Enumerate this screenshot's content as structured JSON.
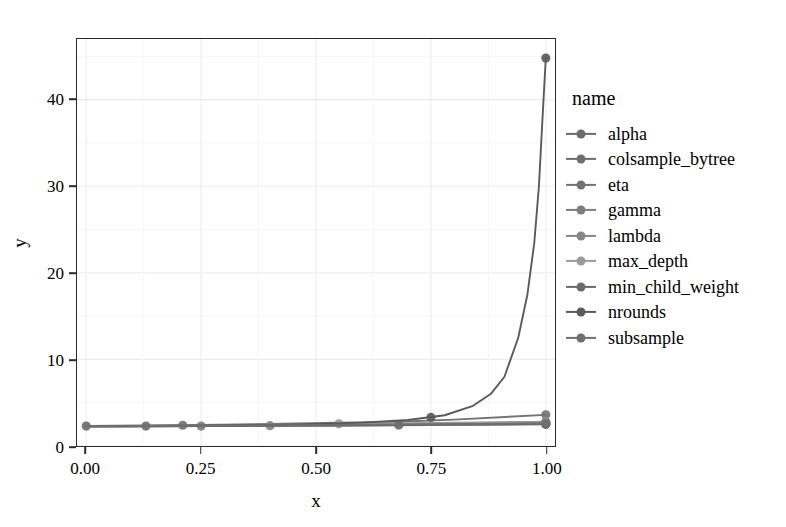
{
  "chart_data": {
    "type": "line",
    "title": "",
    "xlabel": "x",
    "ylabel": "y",
    "xlim": [
      -0.02,
      1.02
    ],
    "ylim": [
      0,
      47
    ],
    "x_ticks": [
      0.0,
      0.25,
      0.5,
      0.75,
      1.0
    ],
    "x_tick_labels": [
      "0.00",
      "0.25",
      "0.50",
      "0.75",
      "1.00"
    ],
    "y_ticks": [
      0,
      10,
      20,
      30,
      40
    ],
    "y_tick_labels": [
      "0",
      "10",
      "20",
      "30",
      "40"
    ],
    "grid": "faint-major-and-minor",
    "legend_title": "name",
    "legend_position": "right",
    "markers": "points-on-lines",
    "series": [
      {
        "name": "alpha",
        "color": "#6b6b6b",
        "x": [
          0.0,
          0.13,
          0.21,
          0.25,
          0.4,
          0.68,
          0.75,
          1.0
        ],
        "y": [
          2.3,
          2.32,
          2.35,
          2.37,
          2.42,
          2.5,
          2.55,
          2.7
        ],
        "point_x": [
          0.0,
          1.0
        ],
        "point_y": [
          2.3,
          2.7
        ]
      },
      {
        "name": "colsample_bytree",
        "color": "#6e6e6e",
        "x": [
          0.0,
          0.13,
          0.25,
          0.4,
          0.5,
          0.68,
          0.75,
          1.0
        ],
        "y": [
          2.28,
          2.3,
          2.33,
          2.4,
          2.44,
          2.52,
          2.58,
          2.8
        ],
        "point_x": [
          0.13,
          1.0
        ],
        "point_y": [
          2.3,
          2.8
        ]
      },
      {
        "name": "eta",
        "color": "#737373",
        "x": [
          0.0,
          0.13,
          0.21,
          0.25,
          0.4,
          0.55,
          0.68,
          0.8,
          1.0
        ],
        "y": [
          2.32,
          2.36,
          2.4,
          2.44,
          2.55,
          2.68,
          2.8,
          3.05,
          3.6
        ],
        "point_x": [
          0.21,
          1.0
        ],
        "point_y": [
          2.4,
          3.6
        ]
      },
      {
        "name": "gamma",
        "color": "#7d7d7d",
        "x": [
          0.0,
          0.13,
          0.25,
          0.4,
          0.55,
          0.68,
          0.75,
          1.0
        ],
        "y": [
          2.26,
          2.28,
          2.3,
          2.33,
          2.36,
          2.4,
          2.42,
          2.5
        ],
        "point_x": [
          0.25,
          1.0
        ],
        "point_y": [
          2.3,
          2.5
        ]
      },
      {
        "name": "lambda",
        "color": "#868686",
        "x": [
          0.0,
          0.13,
          0.25,
          0.4,
          0.55,
          0.68,
          0.75,
          1.0
        ],
        "y": [
          2.27,
          2.28,
          2.31,
          2.35,
          2.38,
          2.42,
          2.45,
          2.55
        ],
        "point_x": [
          0.4,
          1.0
        ],
        "point_y": [
          2.35,
          2.55
        ]
      },
      {
        "name": "max_depth",
        "color": "#9a9a9a",
        "x": [
          0.0,
          0.13,
          0.25,
          0.4,
          0.55,
          0.68,
          0.75,
          1.0
        ],
        "y": [
          2.25,
          2.3,
          2.38,
          2.48,
          2.56,
          2.62,
          2.66,
          2.78
        ],
        "point_x": [
          0.55,
          1.0
        ],
        "point_y": [
          2.56,
          2.78
        ]
      },
      {
        "name": "min_child_weight",
        "color": "#6a6a6a",
        "x": [
          0.0,
          0.13,
          0.25,
          0.4,
          0.55,
          0.68,
          0.75,
          1.0
        ],
        "y": [
          2.24,
          2.26,
          2.29,
          2.33,
          2.37,
          2.41,
          2.44,
          2.52
        ],
        "point_x": [
          0.68,
          1.0
        ],
        "point_y": [
          2.41,
          2.52
        ]
      },
      {
        "name": "nrounds",
        "color": "#5a5a5a",
        "x": [
          0.0,
          0.1,
          0.2,
          0.3,
          0.4,
          0.5,
          0.6,
          0.7,
          0.78,
          0.84,
          0.88,
          0.91,
          0.94,
          0.96,
          0.975,
          0.985,
          0.995,
          1.0
        ],
        "y": [
          2.3,
          2.32,
          2.35,
          2.4,
          2.46,
          2.55,
          2.7,
          3.0,
          3.55,
          4.6,
          6.0,
          8.0,
          12.5,
          17.5,
          23.5,
          30.0,
          40.0,
          44.8
        ],
        "point_x": [
          0.75,
          1.0
        ],
        "point_y": [
          3.3,
          44.8
        ]
      },
      {
        "name": "subsample",
        "color": "#6f6f6f",
        "x": [
          0.0,
          0.13,
          0.25,
          0.4,
          0.55,
          0.68,
          0.75,
          1.0
        ],
        "y": [
          2.29,
          2.31,
          2.34,
          2.39,
          2.44,
          2.49,
          2.52,
          2.62
        ],
        "point_x": [
          1.0
        ],
        "point_y": [
          2.62
        ]
      }
    ]
  }
}
